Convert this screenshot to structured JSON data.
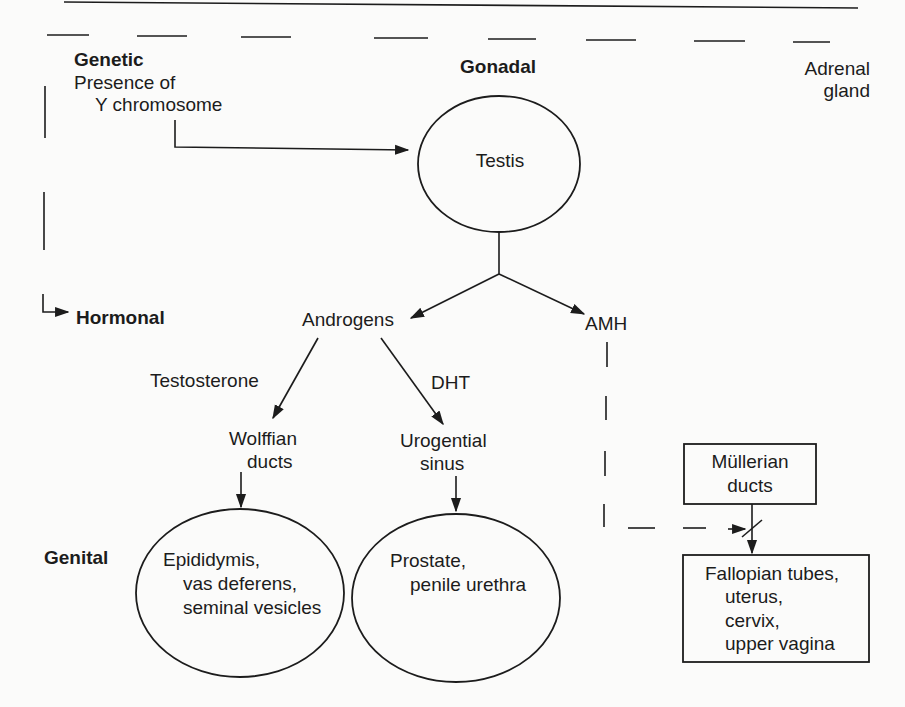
{
  "diagram": {
    "levels": {
      "genetic": "Genetic",
      "gonadal": "Gonadal",
      "hormonal": "Hormonal",
      "genital": "Genital"
    },
    "genetic_factor": {
      "line1": "Presence of",
      "line2": "Y chromosome"
    },
    "adrenal": {
      "line1": "Adrenal",
      "line2": "gland"
    },
    "nodes": {
      "testis": "Testis",
      "androgens": "Androgens",
      "amh": "AMH",
      "testosterone": "Testosterone",
      "dht": "DHT",
      "wolffian": {
        "line1": "Wolffian",
        "line2": "ducts"
      },
      "urogenital": {
        "line1": "Urogential",
        "line2": "sinus"
      },
      "mullerian": {
        "line1": "Müllerian",
        "line2": "ducts"
      }
    },
    "outcomes": {
      "wolffian_derivatives": {
        "line1": "Epididymis,",
        "line2": "vas deferens,",
        "line3": "seminal vesicles"
      },
      "urogenital_derivatives": {
        "line1": "Prostate,",
        "line2": "penile urethra"
      },
      "mullerian_derivatives": {
        "line1": "Fallopian tubes,",
        "line2": "uterus,",
        "line3": "cervix,",
        "line4": "upper vagina"
      }
    },
    "edges": [
      {
        "from": "Y chromosome",
        "to": "Testis",
        "style": "solid"
      },
      {
        "from": "Testis",
        "to": "Androgens",
        "style": "solid"
      },
      {
        "from": "Testis",
        "to": "AMH",
        "style": "solid"
      },
      {
        "from": "Androgens",
        "to": "Wolffian ducts",
        "label": "Testosterone",
        "style": "solid"
      },
      {
        "from": "Androgens",
        "to": "Urogential sinus",
        "label": "DHT",
        "style": "solid"
      },
      {
        "from": "Wolffian ducts",
        "to": "Epididymis, vas deferens, seminal vesicles",
        "style": "solid"
      },
      {
        "from": "Urogential sinus",
        "to": "Prostate, penile urethra",
        "style": "solid"
      },
      {
        "from": "Müllerian ducts",
        "to": "Fallopian tubes, uterus, cervix, upper vagina",
        "style": "solid-blocked"
      },
      {
        "from": "AMH",
        "to": "Müllerian ducts pathway",
        "style": "dashed-inhibit"
      },
      {
        "from": "Genetic",
        "to": "Hormonal",
        "style": "dashed"
      }
    ],
    "colors": {
      "ink": "#1c1c1c",
      "paper": "#fbfbfa"
    }
  }
}
